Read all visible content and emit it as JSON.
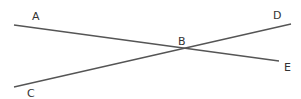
{
  "diagram": {
    "type": "geometry-intersecting-lines",
    "colors": {
      "line": "#555555",
      "label": "#333333",
      "background": "#ffffff"
    },
    "points": [
      {
        "name": "A",
        "label": "A",
        "x": 36,
        "y": 19
      },
      {
        "name": "B",
        "label": "B",
        "x": 182,
        "y": 45
      },
      {
        "name": "C",
        "label": "C",
        "x": 32,
        "y": 97
      },
      {
        "name": "D",
        "label": "D",
        "x": 277,
        "y": 19
      },
      {
        "name": "E",
        "label": "E",
        "x": 288,
        "y": 71
      }
    ],
    "lines": [
      {
        "name": "line-AE",
        "from": "A",
        "to": "E",
        "x1": 14,
        "y1": 25,
        "x2": 279,
        "y2": 61
      },
      {
        "name": "line-CD",
        "from": "C",
        "to": "D",
        "x1": 14,
        "y1": 87,
        "x2": 291,
        "y2": 24
      }
    ],
    "intersection": "B"
  }
}
